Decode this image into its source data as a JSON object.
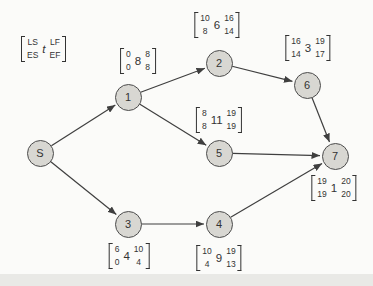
{
  "diagram": {
    "type": "project-network-diagram",
    "legend": {
      "ls": "LS",
      "es": "ES",
      "t": "t",
      "lf": "LF",
      "ef": "EF"
    },
    "colors": {
      "background": "#fbfbf9",
      "footer_strip": "#e9e9e6",
      "node_fill": "#d8d7d2",
      "node_stroke": "#4c4c4c",
      "edge": "#3f3f3f",
      "text": "#333333"
    },
    "node_radius": 13.5,
    "nodes": [
      {
        "id": "S",
        "label": "S",
        "x": 40,
        "y": 153
      },
      {
        "id": "1",
        "label": "1",
        "x": 128,
        "y": 97
      },
      {
        "id": "2",
        "label": "2",
        "x": 219,
        "y": 63
      },
      {
        "id": "3",
        "label": "3",
        "x": 128,
        "y": 224
      },
      {
        "id": "4",
        "label": "4",
        "x": 219,
        "y": 224
      },
      {
        "id": "5",
        "label": "5",
        "x": 219,
        "y": 153
      },
      {
        "id": "6",
        "label": "6",
        "x": 307,
        "y": 85
      },
      {
        "id": "7",
        "label": "7",
        "x": 335,
        "y": 156
      }
    ],
    "edges": [
      {
        "from": "S",
        "to": "1"
      },
      {
        "from": "S",
        "to": "3"
      },
      {
        "from": "1",
        "to": "2"
      },
      {
        "from": "1",
        "to": "5"
      },
      {
        "from": "2",
        "to": "6"
      },
      {
        "from": "6",
        "to": "7"
      },
      {
        "from": "5",
        "to": "7"
      },
      {
        "from": "3",
        "to": "4"
      },
      {
        "from": "4",
        "to": "7"
      }
    ],
    "activity_labels": [
      {
        "node": "1",
        "ls": "0",
        "es": "0",
        "t": "8",
        "lf": "8",
        "ef": "8",
        "x": 138,
        "y": 61
      },
      {
        "node": "2",
        "ls": "10",
        "es": "8",
        "t": "6",
        "lf": "16",
        "ef": "14",
        "x": 217,
        "y": 25
      },
      {
        "node": "6",
        "ls": "16",
        "es": "14",
        "t": "3",
        "lf": "19",
        "ef": "17",
        "x": 308,
        "y": 48
      },
      {
        "node": "5",
        "ls": "8",
        "es": "8",
        "t": "11",
        "lf": "19",
        "ef": "19",
        "x": 219,
        "y": 120
      },
      {
        "node": "7",
        "ls": "19",
        "es": "19",
        "t": "1",
        "lf": "20",
        "ef": "20",
        "x": 334,
        "y": 188
      },
      {
        "node": "3",
        "ls": "6",
        "es": "0",
        "t": "4",
        "lf": "10",
        "ef": "4",
        "x": 129,
        "y": 256
      },
      {
        "node": "4",
        "ls": "10",
        "es": "4",
        "t": "9",
        "lf": "19",
        "ef": "13",
        "x": 219,
        "y": 258
      }
    ]
  }
}
